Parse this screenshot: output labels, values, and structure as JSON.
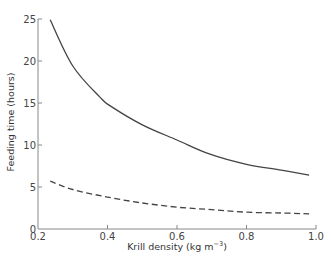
{
  "chart_data": {
    "type": "line",
    "title": "",
    "xlabel": "Krill density (kg m",
    "xlabel_sup": "−3",
    "xlabel_close": ")",
    "ylabel": "Feeding time (hours)",
    "xlim": [
      0.2,
      1.0
    ],
    "ylim": [
      0,
      25
    ],
    "xticks": [
      0.2,
      0.4,
      0.6,
      0.8,
      1.0
    ],
    "xtick_labels": [
      "0.2",
      "0.4",
      "0.6",
      "0.8",
      "1.0"
    ],
    "yticks": [
      0,
      5,
      10,
      15,
      20,
      25
    ],
    "ytick_labels": [
      "0",
      "5",
      "10",
      "15",
      "20",
      "25"
    ],
    "grid": false,
    "legend": null,
    "series": [
      {
        "name": "solid",
        "style": "solid",
        "color": "#444444",
        "x": [
          0.235,
          0.3,
          0.378,
          0.41,
          0.5,
          0.6,
          0.695,
          0.8,
          0.9,
          0.98
        ],
        "y": [
          24.9,
          19.4,
          15.7,
          14.6,
          12.4,
          10.6,
          8.9,
          7.7,
          7.0,
          6.4
        ]
      },
      {
        "name": "dashed",
        "style": "dashed",
        "color": "#444444",
        "x": [
          0.235,
          0.3,
          0.4,
          0.5,
          0.6,
          0.7,
          0.8,
          0.9,
          0.98
        ],
        "y": [
          5.7,
          4.7,
          3.8,
          3.1,
          2.6,
          2.3,
          2.0,
          1.9,
          1.8
        ]
      }
    ]
  }
}
